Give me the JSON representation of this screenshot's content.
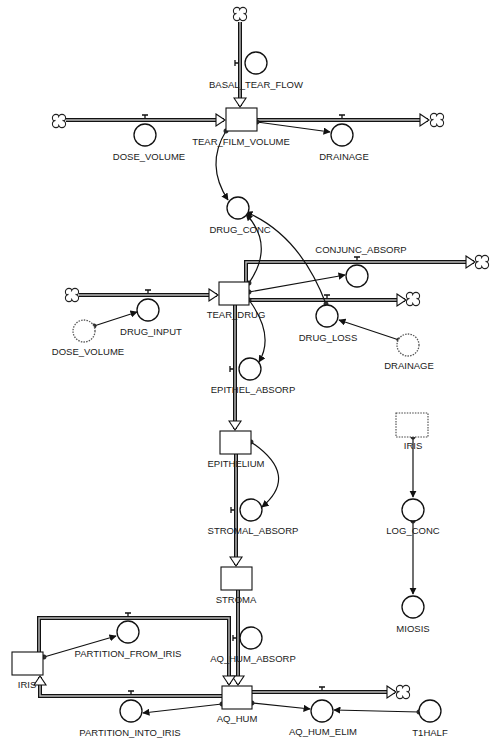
{
  "diagram": {
    "type": "stock-and-flow",
    "colors": {
      "line": "#111111",
      "background": "#ffffff",
      "pipe_inner": "#bbbbbb"
    },
    "stocks": [
      {
        "id": "tear_film_volume",
        "label": "TEAR_FILM_VOLUME",
        "x": 226,
        "y": 108,
        "w": 31,
        "h": 23,
        "lx": 241,
        "ly": 145,
        "ghost": false
      },
      {
        "id": "tear_drug",
        "label": "TEAR_DRUG",
        "x": 219,
        "y": 282,
        "w": 30,
        "h": 23,
        "lx": 236,
        "ly": 318,
        "ghost": false
      },
      {
        "id": "epithelium",
        "label": "EPITHELIUM",
        "x": 220,
        "y": 431,
        "w": 31,
        "h": 23,
        "lx": 236,
        "ly": 467,
        "ghost": false
      },
      {
        "id": "stroma",
        "label": "STROMA",
        "x": 221,
        "y": 567,
        "w": 31,
        "h": 23,
        "lx": 236,
        "ly": 603,
        "ghost": false
      },
      {
        "id": "iris",
        "label": "IRIS",
        "x": 12,
        "y": 652,
        "w": 31,
        "h": 23,
        "lx": 27,
        "ly": 688,
        "ghost": false
      },
      {
        "id": "aq_hum",
        "label": "AQ_HUM",
        "x": 222,
        "y": 686,
        "w": 30,
        "h": 23,
        "lx": 237,
        "ly": 722,
        "ghost": false
      },
      {
        "id": "iris_ghost",
        "label": "IRIS",
        "x": 396,
        "y": 413,
        "w": 32,
        "h": 24,
        "lx": 413,
        "ly": 449,
        "ghost": true
      }
    ],
    "converters": [
      {
        "id": "basal_tear_flow",
        "label": "BASAL_TEAR_FLOW",
        "cx": 256,
        "cy": 63,
        "r": 11,
        "lx": 256,
        "ly": 88,
        "ghost": false
      },
      {
        "id": "dose_volume_1",
        "label": "DOSE_VOLUME",
        "cx": 145,
        "cy": 135,
        "r": 11,
        "lx": 149,
        "ly": 160,
        "ghost": false
      },
      {
        "id": "drainage_1",
        "label": "DRAINAGE",
        "cx": 342,
        "cy": 135,
        "r": 11,
        "lx": 344,
        "ly": 160,
        "ghost": false
      },
      {
        "id": "drug_conc",
        "label": "DRUG_CONC",
        "cx": 238,
        "cy": 208,
        "r": 11,
        "lx": 240,
        "ly": 233,
        "ghost": false
      },
      {
        "id": "conjunc_absorp",
        "label": "CONJUNC_ABSORP",
        "cx": 357,
        "cy": 276,
        "r": 11,
        "lx": 361,
        "ly": 253,
        "ghost": false
      },
      {
        "id": "drug_input",
        "label": "DRUG_INPUT",
        "cx": 148,
        "cy": 310,
        "r": 11,
        "lx": 151,
        "ly": 335,
        "ghost": false
      },
      {
        "id": "drug_loss",
        "label": "DRUG_LOSS",
        "cx": 327,
        "cy": 316,
        "r": 11,
        "lx": 328,
        "ly": 341,
        "ghost": false
      },
      {
        "id": "dose_volume_2",
        "label": "DOSE_VOLUME",
        "cx": 84,
        "cy": 331,
        "r": 11,
        "lx": 88,
        "ly": 355,
        "ghost": true
      },
      {
        "id": "drainage_2",
        "label": "DRAINAGE",
        "cx": 408,
        "cy": 345,
        "r": 11,
        "lx": 409,
        "ly": 369,
        "ghost": true
      },
      {
        "id": "epithel_absorp",
        "label": "EPITHEL_ABSORP",
        "cx": 250,
        "cy": 369,
        "r": 11,
        "lx": 253,
        "ly": 393,
        "ghost": false
      },
      {
        "id": "stromal_absorp",
        "label": "STROMAL_ABSORP",
        "cx": 251,
        "cy": 510,
        "r": 11,
        "lx": 253,
        "ly": 534,
        "ghost": false
      },
      {
        "id": "log_conc",
        "label": "LOG_CONC",
        "cx": 413,
        "cy": 510,
        "r": 11,
        "lx": 413,
        "ly": 534,
        "ghost": false
      },
      {
        "id": "miosis",
        "label": "MIOSIS",
        "cx": 413,
        "cy": 607,
        "r": 11,
        "lx": 413,
        "ly": 632,
        "ghost": false
      },
      {
        "id": "partition_from_iris",
        "label": "PARTITION_FROM_IRIS",
        "cx": 128,
        "cy": 632,
        "r": 11,
        "lx": 128,
        "ly": 657,
        "ghost": false
      },
      {
        "id": "aq_hum_absorp",
        "label": "AQ_HUM_ABSORP",
        "cx": 251,
        "cy": 638,
        "r": 11,
        "lx": 253,
        "ly": 662,
        "ghost": false
      },
      {
        "id": "partition_into_iris",
        "label": "PARTITION_INTO_IRIS",
        "cx": 131,
        "cy": 711,
        "r": 11,
        "lx": 130,
        "ly": 736,
        "ghost": false
      },
      {
        "id": "aq_hum_elim",
        "label": "AQ_HUM_ELIM",
        "cx": 322,
        "cy": 711,
        "r": 11,
        "lx": 323,
        "ly": 735,
        "ghost": false
      },
      {
        "id": "t1half",
        "label": "T1HALF",
        "cx": 430,
        "cy": 711,
        "r": 11,
        "lx": 430,
        "ly": 736,
        "ghost": false
      }
    ],
    "clouds": [
      {
        "id": "cloud_top",
        "x": 240,
        "y": 14
      },
      {
        "id": "cloud_left_1",
        "x": 59,
        "y": 121
      },
      {
        "id": "cloud_right_1",
        "x": 437,
        "y": 120
      },
      {
        "id": "cloud_conjunc",
        "x": 482,
        "y": 262
      },
      {
        "id": "cloud_left_2",
        "x": 72,
        "y": 295
      },
      {
        "id": "cloud_drugloss",
        "x": 413,
        "y": 299
      },
      {
        "id": "cloud_aqhum",
        "x": 403,
        "y": 692
      }
    ],
    "flows": [
      {
        "id": "flow_basal",
        "name": "BASAL_TEAR_FLOW",
        "points": [
          [
            240,
            22
          ],
          [
            240,
            106
          ]
        ],
        "arrow": "down",
        "valve": [
          240,
          63,
          "v"
        ]
      },
      {
        "id": "flow_dose",
        "name": "DOSE_VOLUME",
        "points": [
          [
            66,
            120
          ],
          [
            224,
            120
          ]
        ],
        "arrow": "right",
        "valve": [
          145,
          120,
          "h"
        ]
      },
      {
        "id": "flow_drainage",
        "name": "DRAINAGE",
        "points": [
          [
            257,
            120
          ],
          [
            428,
            120
          ]
        ],
        "arrow": "right",
        "valve": [
          342,
          120,
          "h"
        ]
      },
      {
        "id": "flow_drug_input",
        "name": "DRUG_INPUT",
        "points": [
          [
            79,
            295
          ],
          [
            217,
            295
          ]
        ],
        "arrow": "right",
        "valve": [
          148,
          295,
          "h"
        ]
      },
      {
        "id": "flow_conjunc",
        "name": "CONJUNC_ABSORP",
        "points": [
          [
            246,
            282
          ],
          [
            246,
            262
          ],
          [
            474,
            262
          ]
        ],
        "arrow": "right",
        "valve": [
          357,
          262,
          "h"
        ]
      },
      {
        "id": "flow_drug_loss",
        "name": "DRUG_LOSS",
        "points": [
          [
            249,
            300
          ],
          [
            405,
            300
          ]
        ],
        "arrow": "right",
        "valve": [
          327,
          300,
          "h"
        ]
      },
      {
        "id": "flow_epithel",
        "name": "EPITHEL_ABSORP",
        "points": [
          [
            235,
            305
          ],
          [
            235,
            429
          ]
        ],
        "arrow": "down",
        "valve": [
          235,
          369,
          "v"
        ]
      },
      {
        "id": "flow_stromal",
        "name": "STROMAL_ABSORP",
        "points": [
          [
            236,
            454
          ],
          [
            236,
            565
          ]
        ],
        "arrow": "down",
        "valve": [
          236,
          510,
          "v"
        ]
      },
      {
        "id": "flow_aq_absorp",
        "name": "AQ_HUM_ABSORP",
        "points": [
          [
            238,
            590
          ],
          [
            238,
            684
          ]
        ],
        "arrow": "down",
        "valve": [
          238,
          638,
          "v"
        ]
      },
      {
        "id": "flow_from_iris",
        "name": "PARTITION_FROM_IRIS",
        "points": [
          [
            39,
            652
          ],
          [
            39,
            618
          ],
          [
            229,
            618
          ],
          [
            229,
            684
          ]
        ],
        "arrow": "down",
        "valve": [
          128,
          618,
          "h"
        ]
      },
      {
        "id": "flow_into_iris",
        "name": "PARTITION_INTO_IRIS",
        "points": [
          [
            222,
            696
          ],
          [
            40,
            696
          ],
          [
            40,
            677
          ]
        ],
        "arrow": "up",
        "valve": [
          131,
          696,
          "h"
        ]
      },
      {
        "id": "flow_aq_elim",
        "name": "AQ_HUM_ELIM",
        "points": [
          [
            252,
            692
          ],
          [
            395,
            692
          ]
        ],
        "arrow": "right",
        "valve": [
          322,
          692,
          "h"
        ]
      }
    ],
    "connectors": [
      {
        "id": "c_tfv_drainage",
        "d": "M257,122 L330,132"
      },
      {
        "id": "c_tfv_drugconc",
        "d": "M226,131 Q205,165 228,200"
      },
      {
        "id": "c_drug_drugconc",
        "d": "M249,283 Q275,245 246,214"
      },
      {
        "id": "c_drugloss_drugconc",
        "d": "M326,304 Q300,235 246,212"
      },
      {
        "id": "c_drug_conjunc",
        "d": "M249,292 L345,275"
      },
      {
        "id": "c_dosevol_druginput",
        "d": "M94,326 L137,312"
      },
      {
        "id": "c_drainage_drugloss",
        "d": "M399,340 L339,320"
      },
      {
        "id": "c_drug_epithel",
        "d": "M249,300 Q275,335 259,362"
      },
      {
        "id": "c_epith_stromal",
        "d": "M251,442 Q300,475 262,507"
      },
      {
        "id": "c_iris_logconc",
        "d": "M413,437 L413,497"
      },
      {
        "id": "c_logconc_miosis",
        "d": "M413,521 L413,594"
      },
      {
        "id": "c_iris_partfrom",
        "d": "M44,657 L116,636"
      },
      {
        "id": "c_aqhum_partinto",
        "d": "M222,704 L143,713"
      },
      {
        "id": "c_aqhum_elim",
        "d": "M252,703 L310,709"
      },
      {
        "id": "c_t1half_elim",
        "d": "M419,712 L334,710"
      }
    ]
  }
}
